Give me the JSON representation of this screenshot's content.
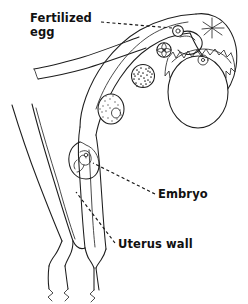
{
  "figure": {
    "name": "mammalian-female-reproductive-tract-fertilization-diagram",
    "background_color": "#ffffff",
    "line_color": "#1d1d1d",
    "text_color": "#111111"
  },
  "labels": {
    "fertilized_egg": "Fertilized\negg",
    "embryo": "Embryo",
    "uterus_wall": "Uterus wall"
  },
  "leaders": {
    "fertilized_egg_leader": "dashed-horizontal-line",
    "embryo_leader": "dashed-diagonal-line",
    "uterus_wall_leader": "dashed-diagonal-line"
  },
  "structures": {
    "ovary": "ovary",
    "fimbriae": "fimbriae-funnel",
    "ruptured_follicle": "ruptured-follicle-starburst",
    "oviduct": "oviduct",
    "uterine_horn_right": "uterine-horn-right",
    "uterine_horn_left": "uterine-horn-left",
    "cervix": "cervix",
    "vagina": "vagina",
    "fertilized_egg_cell": "fertilized-egg-zygote",
    "cleavage_stage": "four-cell-cleavage-stage",
    "morula": "morula",
    "blastocyst": "blastocyst",
    "implanted_embryo": "implanted-embryo"
  }
}
